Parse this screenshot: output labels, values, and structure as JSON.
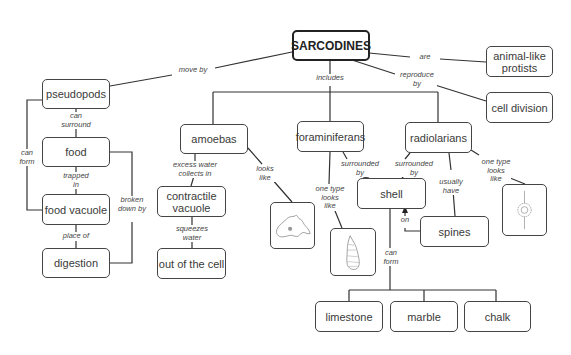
{
  "diagram": {
    "title": "SARCODINES",
    "nodes": {
      "root": "SARCODINES",
      "animal_like_protists": "animal-like protists",
      "cell_division": "cell division",
      "pseudopods": "pseudopods",
      "food": "food",
      "food_vacuole": "food vacuole",
      "digestion": "digestion",
      "amoebas": "amoebas",
      "contractile_vacuole": "contractile vacuole",
      "out_of_the_cell": "out of the cell",
      "foraminiferans": "foraminiferans",
      "radiolarians": "radiolarians",
      "shell": "shell",
      "spines": "spines",
      "limestone": "limestone",
      "marble": "marble",
      "chalk": "chalk"
    },
    "links": {
      "are": "are",
      "reproduce_by": "reproduce by",
      "move_by": "move by",
      "includes": "includes",
      "can_surround": "can surround",
      "can_form_left": "can form",
      "trapped_in": "trapped in",
      "broken_down_by": "broken down by",
      "place_of": "place of",
      "excess_water": "excess water collects in",
      "looks_like_amoeba": "looks like",
      "squeezes_water": "squeezes water",
      "surrounded_by_foram": "surrounded by",
      "surrounded_by_radio": "surrounded by",
      "one_type_foram": "one type looks like",
      "one_type_radio": "one type looks like",
      "usually_have": "usually have",
      "on": "on",
      "can_form_shell": "can form"
    },
    "images": {
      "amoeba": "amoeba-illustration",
      "foraminiferan": "foraminiferan-shell-illustration",
      "radiolarian": "radiolarian-illustration"
    },
    "colors": {
      "line": "#333333",
      "border": "#444444",
      "background": "#ffffff"
    }
  }
}
